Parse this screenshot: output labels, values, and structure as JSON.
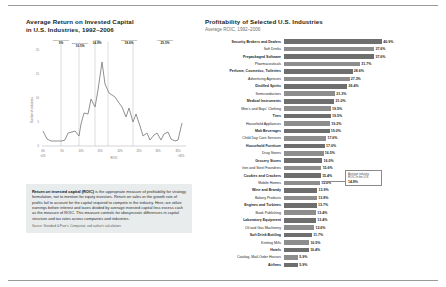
{
  "figure": {
    "left": {
      "title": "Average Return on Invested Capital in U.S. Industries, 1992–2006",
      "title_line1": "Average Return on Invested Capital",
      "title_line2": "in U.S. Industries, 1992–2006",
      "ylabel": "Number of industries",
      "xlabel": "ROIC",
      "y_ticks": [
        "0",
        "5",
        "10",
        "15",
        "20"
      ],
      "x_ticks": [
        "0%",
        "5%",
        "10%",
        "15%",
        "20%",
        "25%",
        "30%",
        "35%"
      ],
      "x_tick_first": "0%",
      "x_tick_last": "35%",
      "x_edge_left": "<0%",
      "x_edge_right": ">35%",
      "markers": [
        {
          "label": "10th percentile",
          "value": "5%"
        },
        {
          "label": "25th percentile",
          "value": "10.5%"
        },
        {
          "label": "Mean",
          "value": "14.9%"
        },
        {
          "label": "75th percentile",
          "value": "18.6%"
        },
        {
          "label": "90th percentile",
          "value": "25.5%"
        }
      ]
    },
    "right": {
      "title": "Profitability of Selected U.S. Industries",
      "subtitle": "Average ROIC, 1992–2006",
      "callout": {
        "line1": "Average industry",
        "line2": "ROIC in the U.S.",
        "value": "14.9%"
      }
    },
    "callout_box": {
      "body": "Return on invested capital (ROIC) is the appropriate measure of profitability for strategy formulation, not to mention for equity investors. Return on sales or the growth rate of profits fail to account for the capital required to compete in the industry. Here, we utilize earnings before interest and taxes divided by average invested capital less excess cash as the measure of ROIC. This measure controls for idiosyncratic differences in capital structure and tax rates across companies and industries.",
      "body_lead": "Return on invested capital (ROIC)",
      "body_rest": " is the appropriate measure of profitability for strategy formulation, not to mention for equity investors. Return on sales or the growth rate of profits fail to account for the capital required to compete in the industry. Here, we utilize earnings before interest and taxes divided by average invested capital less excess cash as the measure of ROIC. This measure controls for idiosyncratic differences in capital structure and tax rates across companies and industries.",
      "source": "Source: Standard & Poor's, Compustat, and author's calculations"
    }
  },
  "chart_data": [
    {
      "type": "bar",
      "orientation": "horizontal",
      "title": "Profitability of Selected U.S. Industries",
      "subtitle": "Average ROIC, 1992–2006",
      "xlabel": "Average ROIC",
      "ylabel": "",
      "xlim": [
        0,
        45
      ],
      "grid": false,
      "legend": false,
      "categories": [
        "Security Brokers and Dealers",
        "Soft Drinks",
        "Prepackaged Software",
        "Pharmaceuticals",
        "Perfume, Cosmetics, Toiletries",
        "Advertising Agencies",
        "Distilled Spirits",
        "Semiconductors",
        "Medical Instruments",
        "Men's and Boys' Clothing",
        "Tires",
        "Household Appliances",
        "Malt Beverages",
        "Child Day Care Services",
        "Household Furniture",
        "Drug Stores",
        "Grocery Stores",
        "Iron and Steel Foundries",
        "Cookies and Crackers",
        "Mobile Homes",
        "Wine and Brandy",
        "Bakery Products",
        "Engines and Turbines",
        "Book Publishing",
        "Laboratory Equipment",
        "Oil and Gas Machinery",
        "Soft Drink Bottling",
        "Knitting Mills",
        "Hotels",
        "Catalog, Mail-Order Houses",
        "Airlines"
      ],
      "values": [
        40.9,
        37.6,
        37.6,
        31.7,
        28.6,
        27.3,
        26.4,
        21.3,
        21.0,
        19.5,
        19.5,
        19.2,
        19.0,
        17.6,
        17.0,
        16.5,
        16.0,
        15.6,
        15.4,
        15.0,
        13.9,
        13.8,
        13.7,
        13.4,
        13.4,
        12.6,
        11.7,
        10.5,
        10.4,
        5.9,
        5.9
      ],
      "value_labels": [
        "40.9%",
        "37.6%",
        "37.6%",
        "31.7%",
        "28.6%",
        "27.3%",
        "26.4%",
        "21.3%",
        "21.0%",
        "19.5%",
        "19.5%",
        "19.2%",
        "19.0%",
        "17.6%",
        "17.0%",
        "16.5%",
        "16.0%",
        "15.6%",
        "15.4%",
        "15.0%",
        "13.9%",
        "13.8%",
        "13.7%",
        "13.4%",
        "13.4%",
        "12.6%",
        "11.7%",
        "10.5%",
        "10.4%",
        "5.9%",
        "5.9%"
      ],
      "annotations": [
        {
          "text": "Average industry ROIC in the U.S. 14.9%",
          "value": 14.9
        }
      ],
      "bar_color": "#8d8d8d",
      "bar_color_alt": "#6e6e6e"
    },
    {
      "type": "line",
      "title": "Average Return on Invested Capital in U.S. Industries, 1992–2006",
      "xlabel": "ROIC",
      "ylabel": "Number of industries",
      "xlim": [
        -2.5,
        37.5
      ],
      "ylim": [
        0,
        22
      ],
      "grid": false,
      "legend": false,
      "x": [
        -1,
        1,
        2,
        3,
        4,
        5,
        6,
        7,
        8,
        9,
        10,
        10.5,
        11,
        12,
        13,
        14,
        14.9,
        15.5,
        16,
        17,
        18,
        18.6,
        19,
        20,
        21,
        22,
        23,
        24,
        25,
        25.5,
        26,
        27,
        28,
        29,
        30,
        31,
        32,
        33,
        34,
        35,
        36
      ],
      "y": [
        3.2,
        1.5,
        1.0,
        1.0,
        1.0,
        1.0,
        1.1,
        2.6,
        2.8,
        3.2,
        2.0,
        4.6,
        6.8,
        6.6,
        9.8,
        8.2,
        11.6,
        17.6,
        13.0,
        11.0,
        10.6,
        10.2,
        9.0,
        8.2,
        6.2,
        8.0,
        5.0,
        6.8,
        4.2,
        2.0,
        2.6,
        1.2,
        2.2,
        2.8,
        1.2,
        2.6,
        3.0,
        1.5,
        1.0,
        1.2,
        4.6
      ],
      "markers": [
        {
          "label": "10th percentile",
          "value_label": "5%",
          "value": 5
        },
        {
          "label": "25th percentile",
          "value_label": "10.5%",
          "value": 10.5
        },
        {
          "label": "Mean",
          "value_label": "14.9%",
          "value": 14.9
        },
        {
          "label": "75th percentile",
          "value_label": "18.6%",
          "value": 18.6
        },
        {
          "label": "90th percentile",
          "value_label": "25.5%",
          "value": 25.5
        }
      ],
      "line_color": "#7d7d7d"
    }
  ]
}
